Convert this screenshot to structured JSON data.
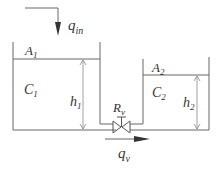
{
  "diagram": {
    "inflow": {
      "symbol": "q",
      "sub": "in"
    },
    "outflow": {
      "symbol": "q",
      "sub": "v"
    },
    "tank1": {
      "area": {
        "symbol": "A",
        "sub": "1"
      },
      "capacitance": {
        "symbol": "C",
        "sub": "1"
      },
      "level": {
        "symbol": "h",
        "sub": "1"
      }
    },
    "tank2": {
      "area": {
        "symbol": "A",
        "sub": "2"
      },
      "capacitance": {
        "symbol": "C",
        "sub": "2"
      },
      "level": {
        "symbol": "h",
        "sub": "2"
      }
    },
    "valve": {
      "symbol": "R",
      "sub": "v"
    },
    "colors": {
      "line": "#555555",
      "text": "#333333"
    }
  }
}
